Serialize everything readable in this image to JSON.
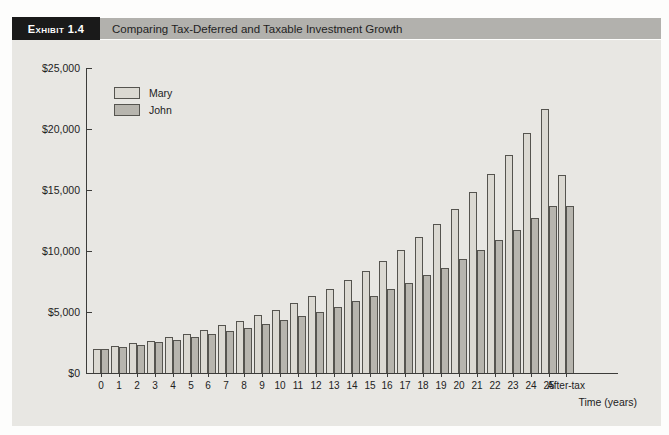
{
  "header": {
    "tag": "Exhibit 1.4",
    "title": "Comparing Tax-Deferred and Taxable Investment Growth"
  },
  "colors": {
    "panel_bg": "#e8e7e3",
    "tag_bg": "#1a1a1a",
    "tag_text": "#ffffff",
    "title_bar_bg": "#b2b1ad",
    "mary_fill": "#dbd9d2",
    "john_fill": "#b7b5ae",
    "bar_border": "#55544f",
    "axis": "#3c3c3a"
  },
  "chart_data": {
    "type": "bar",
    "title": "Comparing Tax-Deferred and Taxable Investment Growth",
    "xlabel": "Time (years)",
    "ylabel": "",
    "ylim": [
      0,
      25000
    ],
    "grid": false,
    "legend_position": "top-left",
    "ytick_values": [
      0,
      5000,
      10000,
      15000,
      20000,
      25000
    ],
    "ytick_labels": [
      "$0",
      "$5,000",
      "$10,000",
      "$15,000",
      "$20,000",
      "$25,000"
    ],
    "categories": [
      "0",
      "1",
      "2",
      "3",
      "4",
      "5",
      "6",
      "7",
      "8",
      "9",
      "10",
      "11",
      "12",
      "13",
      "14",
      "15",
      "16",
      "17",
      "18",
      "19",
      "20",
      "21",
      "22",
      "23",
      "24",
      "25",
      "After-tax"
    ],
    "series": [
      {
        "name": "Mary",
        "values": [
          2000,
          2200,
          2420,
          2662,
          2928,
          3221,
          3543,
          3897,
          4287,
          4716,
          5187,
          5706,
          6277,
          6905,
          7595,
          8354,
          9190,
          10109,
          11120,
          12232,
          13455,
          14800,
          16281,
          17909,
          19699,
          21669,
          16252
        ]
      },
      {
        "name": "John",
        "values": [
          2000,
          2160,
          2333,
          2519,
          2721,
          2939,
          3174,
          3428,
          3702,
          3998,
          4318,
          4663,
          5036,
          5439,
          5874,
          6344,
          6851,
          7400,
          7992,
          8631,
          9322,
          10067,
          10873,
          11742,
          12682,
          13696,
          13696
        ]
      }
    ]
  }
}
